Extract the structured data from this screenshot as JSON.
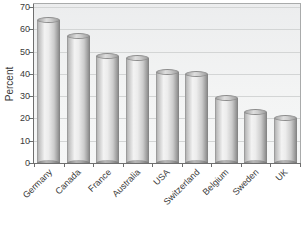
{
  "chart_data": {
    "type": "bar",
    "bar_style": "3d-cylinder",
    "title": "",
    "xlabel": "",
    "ylabel": "Percent",
    "categories": [
      "Germany",
      "Canada",
      "France",
      "Australia",
      "USA",
      "Switzerland",
      "Belgium",
      "Sweden",
      "UK"
    ],
    "values": [
      64,
      57,
      48,
      47,
      41,
      40,
      29,
      23,
      20
    ],
    "ylim": [
      0,
      70
    ],
    "yticks": [
      0,
      10,
      20,
      30,
      40,
      50,
      60,
      70
    ],
    "grid": true,
    "legend": false,
    "category_label_rotation_deg": -45,
    "colors": {
      "background": "#ffffff",
      "plot_background": "#f1f2f2",
      "gridline": "#d3d5d5",
      "axis": "#6e6e6e",
      "frame": "#a9abab",
      "text": "#3a3a3a",
      "bar_highlight": "#f3f3f3",
      "bar_shadow": "#7f7f7f",
      "bar_cap": "#cfcfcf"
    }
  }
}
